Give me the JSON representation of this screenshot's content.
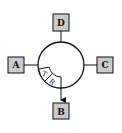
{
  "diagram": {
    "nodes": [
      {
        "id": "D",
        "label": "D",
        "position": "top"
      },
      {
        "id": "A",
        "label": "A",
        "position": "left"
      },
      {
        "id": "C",
        "label": "C",
        "position": "right"
      },
      {
        "id": "B",
        "label": "B",
        "position": "bottom"
      }
    ],
    "ring": {
      "sectors": [
        {
          "label": "T"
        },
        {
          "label": "R"
        }
      ]
    },
    "edges": [
      {
        "from": "ring",
        "to": "D",
        "arrow": false
      },
      {
        "from": "ring",
        "to": "A",
        "arrow": false
      },
      {
        "from": "ring",
        "to": "C",
        "arrow": false
      },
      {
        "from": "ring",
        "to": "B",
        "arrow": true
      }
    ],
    "colors": {
      "box_fill": "#d4d4d4",
      "stroke": "#111111",
      "background": "#ffffff"
    }
  }
}
